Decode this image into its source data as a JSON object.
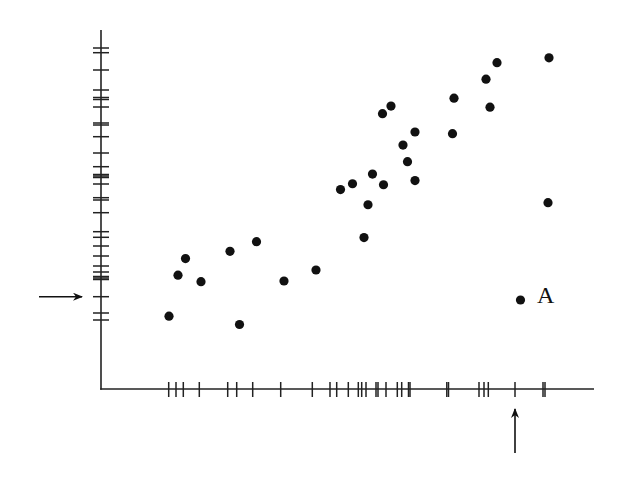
{
  "chart_data": {
    "type": "scatter",
    "title": "",
    "xlabel": "",
    "ylabel": "",
    "grid": false,
    "legend": null,
    "rug_plots": true,
    "xlim": [
      0,
      100
    ],
    "ylim": [
      0,
      100
    ],
    "points": [
      {
        "x": 13.6,
        "y": 21.1
      },
      {
        "x": 15.4,
        "y": 33.0
      },
      {
        "x": 16.9,
        "y": 37.8
      },
      {
        "x": 20.0,
        "y": 31.1
      },
      {
        "x": 25.8,
        "y": 39.9
      },
      {
        "x": 27.7,
        "y": 18.7
      },
      {
        "x": 31.1,
        "y": 42.7
      },
      {
        "x": 36.6,
        "y": 31.3
      },
      {
        "x": 43.0,
        "y": 34.5
      },
      {
        "x": 47.9,
        "y": 57.8
      },
      {
        "x": 50.3,
        "y": 59.5
      },
      {
        "x": 52.6,
        "y": 43.9
      },
      {
        "x": 53.4,
        "y": 53.4
      },
      {
        "x": 54.3,
        "y": 62.3
      },
      {
        "x": 56.5,
        "y": 59.2
      },
      {
        "x": 56.3,
        "y": 79.8
      },
      {
        "x": 58.0,
        "y": 82.0
      },
      {
        "x": 60.4,
        "y": 70.7
      },
      {
        "x": 61.3,
        "y": 65.9
      },
      {
        "x": 62.8,
        "y": 74.5
      },
      {
        "x": 62.8,
        "y": 60.4
      },
      {
        "x": 70.6,
        "y": 84.3
      },
      {
        "x": 70.3,
        "y": 74.0
      },
      {
        "x": 77.0,
        "y": 89.8
      },
      {
        "x": 77.8,
        "y": 81.7
      },
      {
        "x": 79.2,
        "y": 94.6
      },
      {
        "x": 89.4,
        "y": 54.0
      },
      {
        "x": 89.6,
        "y": 96.0
      },
      {
        "x": 83.9,
        "y": 25.8,
        "label": "A"
      }
    ],
    "annotations": [
      {
        "text": "A",
        "target": "outlier point",
        "x": 83.9,
        "y": 25.8
      },
      {
        "type": "arrow",
        "axis": "x",
        "pointing": "up",
        "at_x": 83.9
      },
      {
        "type": "arrow",
        "axis": "y",
        "pointing": "right",
        "at_y": 25.8
      }
    ]
  },
  "plot": {
    "origin_px": {
      "x": 101,
      "y": 389
    },
    "scale_px": {
      "x": 5.0,
      "y": 3.45
    },
    "axis_end_px": {
      "x": 594,
      "y": 30
    },
    "point_color": "#111111",
    "axis_color": "#222222",
    "point_radius": 4.6
  },
  "rug_x_px": [
    168.7,
    176,
    183.3,
    199.3,
    227.7,
    236.7,
    252.7,
    280.7,
    312.3,
    330,
    336.7,
    348.3,
    358.3,
    361.7,
    366,
    376,
    378,
    386,
    397.3,
    401.7,
    408.5,
    410,
    446.8,
    448.5,
    479,
    484,
    488.3,
    515,
    543,
    545
  ],
  "rug_y_px": [
    48,
    52.7,
    70,
    90,
    97.5,
    99.5,
    107,
    123,
    125,
    136.7,
    153,
    166.7,
    174.5,
    176,
    177.5,
    184,
    197.7,
    200,
    212.7,
    231.7,
    237.3,
    246,
    256,
    266,
    272,
    276.5,
    278,
    279.5,
    296.7,
    313,
    320
  ],
  "label_a": "A"
}
